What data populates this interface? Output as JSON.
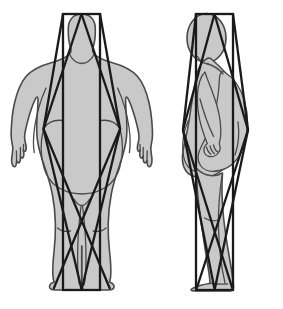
{
  "figure": {
    "background_color": "#ffffff",
    "body_fill_color": "#c9c9c9",
    "body_outline_color": "#4a4a4a",
    "overlay_color": "#1a1a1a",
    "views": [
      {
        "id": "front-view",
        "label": "Front view",
        "position": "left",
        "overlay": {
          "rectangle": {
            "x": 63,
            "y": 14,
            "width": 37,
            "height": 276
          },
          "diagonals": "double-X from head apex to foot apex"
        }
      },
      {
        "id": "side-view",
        "label": "Side view",
        "position": "right",
        "overlay": {
          "rectangle": {
            "x": 196,
            "y": 14,
            "width": 37,
            "height": 276
          },
          "diagonals": "double-X from head apex to foot apex"
        }
      }
    ]
  }
}
